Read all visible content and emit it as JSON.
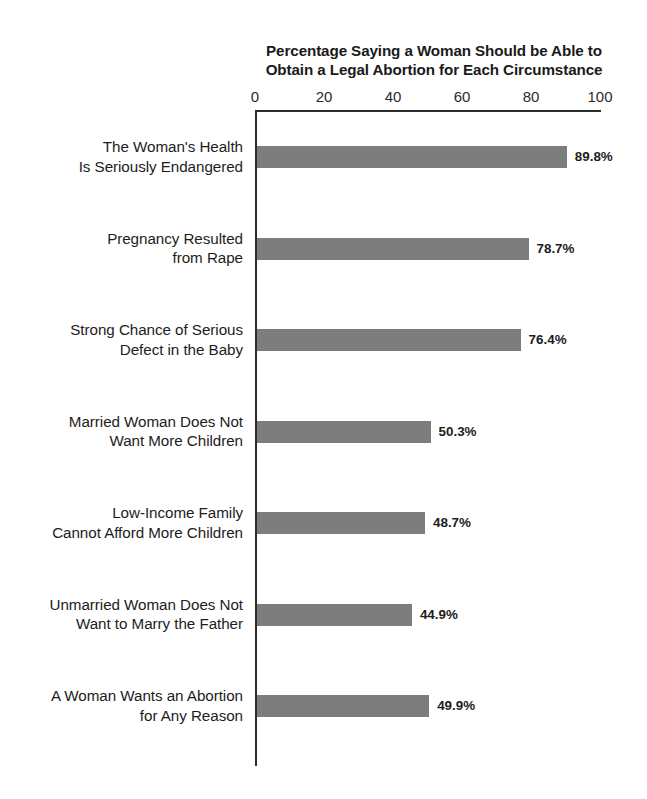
{
  "top_sliver": "",
  "chart_data": {
    "type": "bar",
    "orientation": "horizontal",
    "title": "Percentage Saying a Woman Should be Able to Obtain a Legal Abortion for Each Circumstance",
    "title_lines": [
      "Percentage Saying a Woman Should be Able to",
      "Obtain a Legal Abortion for Each Circumstance"
    ],
    "xlabel": "",
    "ylabel": "",
    "xlim": [
      0,
      100
    ],
    "ticks": [
      0,
      20,
      40,
      60,
      80,
      100
    ],
    "tick_labels": [
      "0",
      "20",
      "40",
      "60",
      "80",
      "100"
    ],
    "grid": false,
    "legend": "none",
    "bar_color": "#7d7d7d",
    "axis_color": "#2c2c2c",
    "categories": [
      "The Woman's Health Is Seriously Endangered",
      "Pregnancy Resulted from Rape",
      "Strong Chance of Serious Defect in the Baby",
      "Married Woman Does Not Want More Children",
      "Low-Income Family Cannot Afford More Children",
      "Unmarried Woman Does Not Want to Marry the Father",
      "A Woman Wants an Abortion for Any Reason"
    ],
    "category_lines": [
      [
        "The Woman's Health",
        "Is Seriously Endangered"
      ],
      [
        "Pregnancy Resulted",
        "from Rape"
      ],
      [
        "Strong Chance of Serious",
        "Defect in the Baby"
      ],
      [
        "Married Woman Does Not",
        "Want More Children"
      ],
      [
        "Low-Income Family",
        "Cannot Afford More Children"
      ],
      [
        "Unmarried Woman Does Not",
        "Want to Marry the Father"
      ],
      [
        "A Woman Wants an Abortion",
        "for Any Reason"
      ]
    ],
    "values": [
      89.8,
      78.7,
      76.4,
      50.3,
      48.7,
      44.9,
      49.9
    ],
    "value_labels": [
      "89.8%",
      "78.7%",
      "76.4%",
      "50.3%",
      "48.7%",
      "44.9%",
      "49.9%"
    ]
  }
}
